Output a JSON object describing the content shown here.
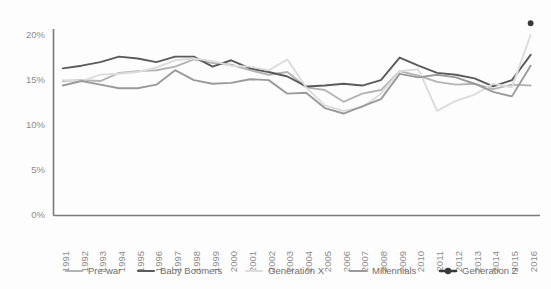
{
  "chart_data": {
    "type": "line",
    "title": "",
    "xlabel": "",
    "ylabel": "",
    "ylim": [
      0,
      22
    ],
    "xlim": [
      1991,
      2016
    ],
    "grid": false,
    "legend_position": "bottom",
    "ytick_labels": [
      "0%",
      "5%",
      "10%",
      "15%",
      "20%"
    ],
    "ytick_values": [
      0,
      5,
      10,
      15,
      20
    ],
    "categories": [
      "1991",
      "1992",
      "1993",
      "1994",
      "1995",
      "1996",
      "1997",
      "1998",
      "1999",
      "2000",
      "2001",
      "2002",
      "2003",
      "2004",
      "2005",
      "2006",
      "2007",
      "2008",
      "2009",
      "2010",
      "2011",
      "2012",
      "2013",
      "2014",
      "2015",
      "2016"
    ],
    "series": [
      {
        "name": "Pre-war",
        "color": "#b4b4b4",
        "marker": false,
        "values": [
          14.9,
          15.0,
          14.9,
          15.8,
          16.0,
          16.1,
          16.5,
          17.3,
          16.9,
          16.7,
          16.1,
          15.6,
          15.9,
          14.2,
          13.9,
          12.6,
          13.5,
          13.9,
          16.0,
          15.5,
          14.8,
          14.5,
          14.6,
          14.0,
          14.5,
          14.4
        ]
      },
      {
        "name": "Baby Boomers",
        "color": "#5b5b5b",
        "marker": false,
        "values": [
          16.3,
          16.6,
          17.0,
          17.6,
          17.4,
          17.0,
          17.6,
          17.6,
          16.5,
          17.2,
          16.3,
          15.9,
          15.4,
          14.3,
          14.4,
          14.6,
          14.4,
          15.0,
          17.5,
          16.6,
          15.8,
          15.6,
          15.2,
          14.3,
          15.0,
          17.8
        ]
      },
      {
        "name": "Generation X",
        "color": "#dcdcdc",
        "marker": false,
        "values": [
          15.0,
          14.9,
          15.6,
          15.7,
          15.9,
          16.4,
          17.2,
          17.4,
          17.1,
          16.6,
          16.5,
          16.1,
          17.3,
          14.2,
          12.2,
          11.6,
          12.0,
          13.5,
          16.0,
          16.2,
          11.6,
          12.7,
          13.4,
          14.6,
          14.2,
          20.0
        ]
      },
      {
        "name": "Millennials",
        "color": "#9a9a9a",
        "marker": false,
        "values": [
          14.4,
          14.9,
          14.5,
          14.1,
          14.1,
          14.5,
          16.1,
          15.0,
          14.6,
          14.7,
          15.1,
          15.0,
          13.5,
          13.6,
          11.9,
          11.3,
          12.1,
          12.9,
          15.7,
          15.3,
          15.6,
          15.3,
          14.6,
          13.7,
          13.2,
          16.6
        ]
      },
      {
        "name": "Generation Z",
        "color": "#3a3a3a",
        "marker": true,
        "values": [
          null,
          null,
          null,
          null,
          null,
          null,
          null,
          null,
          null,
          null,
          null,
          null,
          null,
          null,
          null,
          null,
          null,
          null,
          null,
          null,
          null,
          null,
          null,
          null,
          null,
          21.3
        ]
      }
    ]
  },
  "legend": {
    "items": [
      {
        "label": "Pre-war",
        "color": "#b4b4b4",
        "marker": false
      },
      {
        "label": "Baby Boomers",
        "color": "#5b5b5b",
        "marker": false
      },
      {
        "label": "Generation X",
        "color": "#dcdcdc",
        "marker": false
      },
      {
        "label": "Millennials",
        "color": "#9a9a9a",
        "marker": false
      },
      {
        "label": "Generation Z",
        "color": "#3a3a3a",
        "marker": true
      }
    ]
  }
}
